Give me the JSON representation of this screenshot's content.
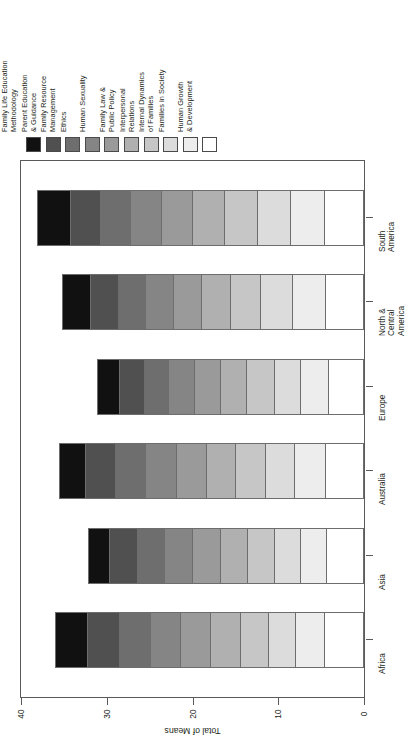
{
  "chart_data": {
    "type": "bar",
    "orientation": "horizontal-stacked",
    "rotated_90": true,
    "title": "",
    "xlabel": "",
    "ylabel": "Total of Means",
    "axis_title": "Total of Means",
    "ylim": [
      0,
      40
    ],
    "ticks": [
      0,
      10,
      20,
      30,
      40
    ],
    "tick_labels": [
      "0",
      "10",
      "20",
      "30",
      "40"
    ],
    "grid": false,
    "legend_position": "top",
    "categories": [
      "Africa",
      "Asia",
      "Australia",
      "Europe",
      "North &\nCentral\nAmerica",
      "South\nAmerica"
    ],
    "series": [
      {
        "name": "Human Growth\n& Development",
        "color": "#ffffff",
        "values": [
          4.5,
          4.3,
          4.4,
          4.1,
          4.4,
          4.5
        ]
      },
      {
        "name": "Families in Society",
        "color": "#ededed",
        "values": [
          3.4,
          3.1,
          3.6,
          3.2,
          3.9,
          4.0
        ]
      },
      {
        "name": "Internal Dynamics\nof Families",
        "color": "#dcdcdc",
        "values": [
          3.2,
          3.0,
          3.4,
          3.1,
          3.7,
          3.9
        ]
      },
      {
        "name": "Interpersonal\nRelations",
        "color": "#c6c6c6",
        "values": [
          3.3,
          3.1,
          3.5,
          3.2,
          3.5,
          3.8
        ]
      },
      {
        "name": "Family Law &\nPublic Policy",
        "color": "#b0b0b0",
        "values": [
          3.4,
          3.2,
          3.4,
          3.1,
          3.4,
          3.7
        ]
      },
      {
        "name": "Human Sexuality",
        "color": "#9a9a9a",
        "values": [
          3.5,
          3.2,
          3.5,
          3.0,
          3.3,
          3.7
        ]
      },
      {
        "name": "Ethics",
        "color": "#858585",
        "values": [
          3.6,
          3.3,
          3.6,
          3.0,
          3.2,
          3.6
        ]
      },
      {
        "name": "Family Resource\nManagement",
        "color": "#6e6e6e",
        "values": [
          3.6,
          3.2,
          3.5,
          2.9,
          3.2,
          3.5
        ]
      },
      {
        "name": "Parent Education\n& Guidance",
        "color": "#505050",
        "values": [
          3.7,
          3.2,
          3.5,
          2.9,
          3.2,
          3.5
        ]
      },
      {
        "name": "Family Life Education\nMethodology",
        "color": "#111111",
        "values": [
          3.8,
          2.6,
          3.2,
          2.7,
          3.4,
          3.9
        ]
      }
    ],
    "totals": [
      36.0,
      32.2,
      35.6,
      31.2,
      35.2,
      38.1
    ]
  },
  "legend": {
    "items": [
      {
        "label": "Family Life Education\nMethodology",
        "color": "#111111"
      },
      {
        "label": "Parent Education\n& Guidance",
        "color": "#505050"
      },
      {
        "label": "Family Resource\nManagement",
        "color": "#6e6e6e"
      },
      {
        "label": "Ethics",
        "color": "#858585"
      },
      {
        "label": "Human Sexuality",
        "color": "#9a9a9a"
      },
      {
        "label": "Family Law &\nPublic Policy",
        "color": "#b0b0b0"
      },
      {
        "label": "Interpersonal\nRelations",
        "color": "#c6c6c6"
      },
      {
        "label": "Internal Dynamics\nof Families",
        "color": "#dcdcdc"
      },
      {
        "label": "Families in Society",
        "color": "#ededed"
      },
      {
        "label": "Human Growth\n& Development",
        "color": "#ffffff"
      }
    ]
  }
}
